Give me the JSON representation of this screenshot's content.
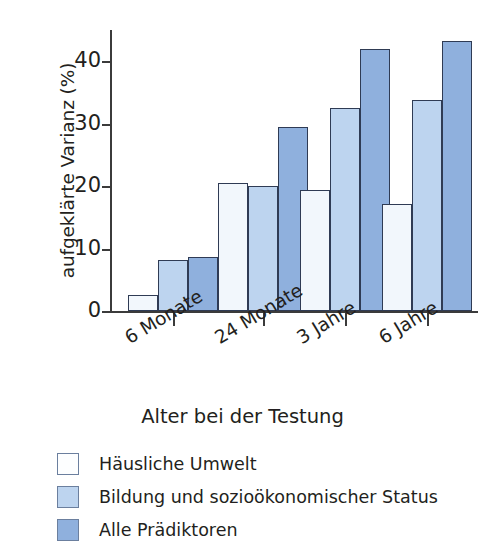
{
  "chart_data": {
    "type": "bar",
    "title": "",
    "xlabel": "Alter bei der Testung",
    "ylabel": "aufgeklärte Varianz (%)",
    "categories": [
      "6 Monate",
      "24 Monate",
      "3 Jahre",
      "6 Jahre"
    ],
    "series": [
      {
        "name": "Häusliche Umwelt",
        "color": "#f2f7fc",
        "values": [
          2.5,
          20.5,
          19.4,
          17.1
        ]
      },
      {
        "name": "Bildung und sozioökonomischer Status",
        "color": "#bdd4ef",
        "values": [
          8.1,
          20.0,
          32.5,
          33.8
        ]
      },
      {
        "name": "Alle Prädiktoren",
        "color": "#8fb0dd",
        "values": [
          8.6,
          29.4,
          42.0,
          43.2
        ]
      }
    ],
    "ylim": [
      0,
      45
    ],
    "yticks": [
      0,
      10,
      20,
      30,
      40
    ],
    "ytick_labels": [
      "0",
      "10",
      "20",
      "30",
      "40"
    ],
    "grid": false,
    "legend_position": "below",
    "xtick_label_rotation_deg": -31
  },
  "axes": {
    "y_title": "aufgeklärte Varianz (%)",
    "x_title": "Alter bei der Testung"
  },
  "legend": {
    "entries": [
      {
        "label": "Häusliche Umwelt",
        "swatch": "series-0"
      },
      {
        "label": "Bildung und sozioökonomischer Status",
        "swatch": "series-1"
      },
      {
        "label": "Alle Prädiktoren",
        "swatch": "series-2"
      }
    ]
  }
}
